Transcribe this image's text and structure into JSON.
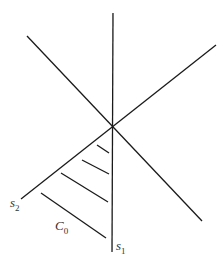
{
  "diagram": {
    "labels": {
      "s1": {
        "base": "s",
        "sub": "1"
      },
      "s2": {
        "base": "s",
        "sub": "2"
      },
      "c0": {
        "base": "C",
        "sub": "0"
      }
    },
    "line_color": "#1a1a1a"
  }
}
